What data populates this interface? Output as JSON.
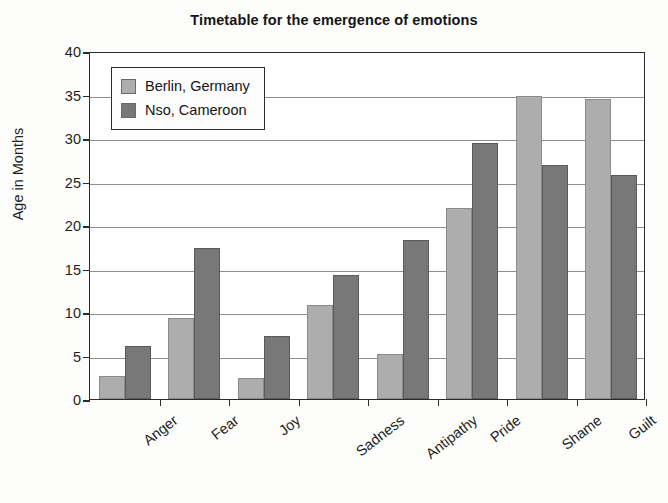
{
  "chart_data": {
    "type": "bar",
    "title": "Timetable for the emergence of emotions",
    "xlabel": "",
    "ylabel": "Age in Months",
    "categories": [
      "Anger",
      "Fear",
      "Joy",
      "Sadness",
      "Antipathy",
      "Pride",
      "Shame",
      "Guilt"
    ],
    "series": [
      {
        "name": "Berlin, Germany",
        "color": "#adadad",
        "values": [
          2.6,
          9.3,
          2.4,
          10.8,
          5.2,
          21.9,
          34.8,
          34.5
        ]
      },
      {
        "name": "Nso, Cameroon",
        "color": "#787878",
        "values": [
          6.1,
          17.4,
          7.3,
          14.3,
          18.3,
          29.4,
          26.9,
          25.8
        ]
      }
    ],
    "ylim": [
      0,
      40
    ],
    "ytick_labels": [
      "40",
      "35",
      "30",
      "25",
      "20",
      "15",
      "10",
      "5",
      "0"
    ],
    "ytick_values": [
      40,
      35,
      30,
      25,
      20,
      15,
      10,
      5,
      0
    ],
    "ytick_step": 5,
    "grid": true,
    "legend_position": "upper-left-inside"
  }
}
